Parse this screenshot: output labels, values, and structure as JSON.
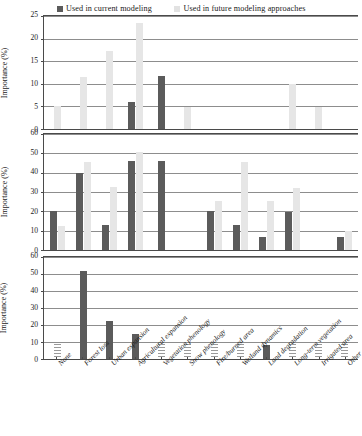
{
  "legend": {
    "entries": [
      {
        "label": "Used in current modeling",
        "color": "#5b5b5b",
        "key": "current"
      },
      {
        "label": "Used in future modeling approaches",
        "color": "#e2e2e2",
        "key": "future"
      }
    ]
  },
  "axis_title": "Importance (%)",
  "chart_data": [
    {
      "type": "bar",
      "title": "",
      "panel": 1,
      "xlabel": "",
      "ylabel": "Importance (%)",
      "ylim": [
        0,
        25
      ],
      "yticks": [
        0,
        5,
        10,
        15,
        20,
        25
      ],
      "grid": true,
      "legend_position": "top-center",
      "categories": [
        "None",
        "Forest loss",
        "Urban expansion",
        "Agricultural expansion",
        "Vegetation phenology",
        "Snow phenology",
        "Fire/burned area",
        "Wetland dynamics",
        "Land degradation",
        "Long-term vegetation",
        "Irrigated area",
        "Other"
      ],
      "series": [
        {
          "name": "Used in current modeling",
          "values": [
            0,
            0,
            0,
            5.9,
            11.7,
            0,
            0,
            0,
            0,
            0,
            0,
            0
          ]
        },
        {
          "name": "Used in future modeling approaches",
          "values": [
            5.0,
            11.5,
            17.3,
            23.5,
            0,
            4.8,
            0,
            0,
            0,
            10.0,
            4.8,
            0
          ]
        }
      ]
    },
    {
      "type": "bar",
      "title": "",
      "panel": 2,
      "xlabel": "",
      "ylabel": "Importance (%)",
      "ylim": [
        0,
        60
      ],
      "yticks": [
        0,
        10,
        20,
        30,
        40,
        50,
        60
      ],
      "grid": true,
      "legend_position": "top-center",
      "categories": [
        "None",
        "Forest loss",
        "Urban expansion",
        "Agricultural expansion",
        "Vegetation phenology",
        "Snow phenology",
        "Fire/burned area",
        "Wetland dynamics",
        "Land degradation",
        "Long-term vegetation",
        "Irrigated area",
        "Other"
      ],
      "series": [
        {
          "name": "Used in current modeling",
          "values": [
            20,
            40,
            13,
            46,
            46,
            0,
            20,
            13,
            6.5,
            19.5,
            0,
            6.5
          ]
        },
        {
          "name": "Used in future modeling approaches",
          "values": [
            12.5,
            45.5,
            32.5,
            50.5,
            0,
            0,
            25.5,
            45.5,
            25.5,
            32,
            0,
            10
          ]
        }
      ]
    },
    {
      "type": "bar",
      "title": "",
      "panel": 3,
      "xlabel": "",
      "ylabel": "Importance (%)",
      "ylim": [
        0,
        60
      ],
      "yticks": [
        0,
        10,
        20,
        30,
        40,
        50,
        60
      ],
      "grid": true,
      "legend_position": "top-center",
      "categories": [
        "None",
        "Forest loss",
        "Urban expansion",
        "Agricultural expansion",
        "Vegetation phenology",
        "Snow phenology",
        "Fire/burned area",
        "Wetland dynamics",
        "Land degradation",
        "Long-term vegetation",
        "Irrigated area",
        "Other"
      ],
      "series": [
        {
          "name": "Used in current modeling",
          "values": [
            0,
            51.5,
            22.5,
            15,
            0,
            0,
            0,
            0,
            8.5,
            0,
            0,
            0
          ]
        },
        {
          "name": "Used in future modeling approaches",
          "values": [
            9,
            0,
            0,
            0,
            9,
            9,
            9,
            9,
            0,
            9,
            9,
            9
          ]
        }
      ],
      "future_bar_style": "hatched"
    }
  ]
}
